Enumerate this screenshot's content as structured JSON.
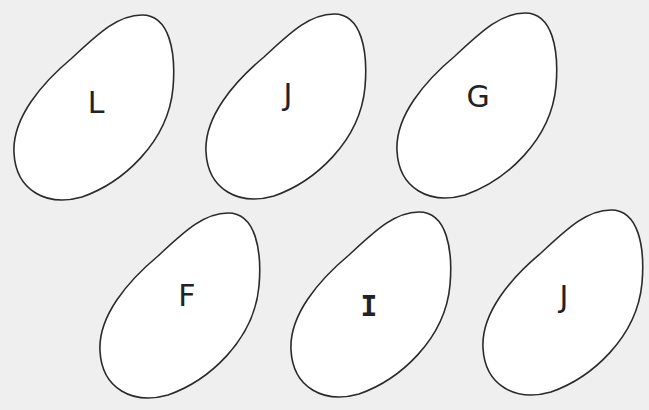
{
  "background": "#efefef",
  "shape_fill": "#ffffff",
  "shape_stroke": "#2a2a2a",
  "blobs": [
    {
      "letter": "L",
      "x": 12,
      "y": 13,
      "lx": 84,
      "ly": 90,
      "style": "sans"
    },
    {
      "letter": "J",
      "x": 204,
      "y": 12,
      "lx": 84,
      "ly": 83,
      "style": "sans"
    },
    {
      "letter": "G",
      "x": 395,
      "y": 11,
      "lx": 83,
      "ly": 86,
      "style": "sans"
    },
    {
      "letter": "F",
      "x": 98,
      "y": 211,
      "lx": 89,
      "ly": 85,
      "style": "sans"
    },
    {
      "letter": "I",
      "x": 289,
      "y": 210,
      "lx": 80,
      "ly": 97,
      "style": "serif"
    },
    {
      "letter": "J",
      "x": 481,
      "y": 208,
      "lx": 83,
      "ly": 89,
      "style": "sans"
    }
  ]
}
